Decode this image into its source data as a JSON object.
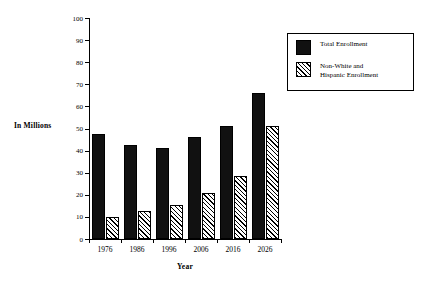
{
  "chart_data": {
    "type": "bar",
    "title": "",
    "xlabel": "Year",
    "ylabel": "In Millions",
    "categories": [
      "1976",
      "1986",
      "1996",
      "2006",
      "2016",
      "2026"
    ],
    "ylim": [
      0,
      100
    ],
    "yticks": [
      0,
      10,
      20,
      30,
      40,
      50,
      60,
      70,
      80,
      90,
      100
    ],
    "grid": false,
    "legend_position": "right",
    "series": [
      {
        "name": "Total Enrollment",
        "fill": "solid-black",
        "color": "#111111",
        "values": [
          47.5,
          42.5,
          41,
          46,
          51,
          66
        ]
      },
      {
        "name": "Non-White and Hispanic Enrollment",
        "fill": "diagonal-hatch",
        "color": "#ffffff",
        "values": [
          10,
          12.5,
          15.5,
          21,
          28.5,
          51
        ]
      }
    ]
  },
  "legend": {
    "entries": [
      {
        "label": "Total Enrollment"
      },
      {
        "label": "Non-White and\nHispanic Enrollment"
      }
    ]
  }
}
